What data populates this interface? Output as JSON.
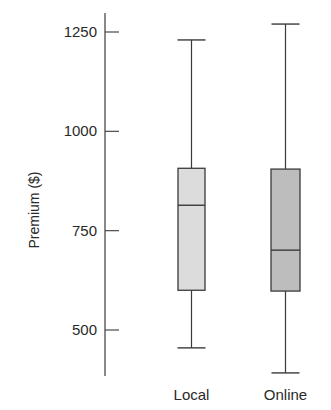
{
  "chart_data": {
    "type": "boxplot",
    "title": "",
    "xlabel": "",
    "ylabel": "Premium ($)",
    "ylim": [
      375,
      1300
    ],
    "yticks": [
      500,
      750,
      1000,
      1250
    ],
    "grid": false,
    "legend": null,
    "categories": [
      "Local",
      "Online"
    ],
    "series": [
      {
        "name": "Local",
        "min": 455,
        "q1": 600,
        "median": 814,
        "q3": 907,
        "max": 1230,
        "fill": "#dcdcdc"
      },
      {
        "name": "Online",
        "min": 392,
        "q1": 598,
        "median": 701,
        "q3": 905,
        "max": 1270,
        "fill": "#bdbdbd"
      }
    ]
  },
  "colors": {
    "axis": "#4a4a4a",
    "stroke": "#3a3a3a",
    "text": "#2a2a2a"
  }
}
